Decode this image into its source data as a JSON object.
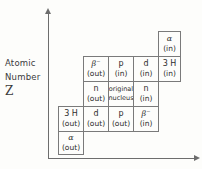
{
  "axis": {
    "y_label_line1": "Atomic",
    "y_label_line2": "Number",
    "y_label_symbol": "Z"
  },
  "chart_data": {
    "type": "diagram",
    "title": "",
    "xlabel": "",
    "ylabel": "Atomic Number Z",
    "grid": true,
    "legend": "none",
    "cells": [
      {
        "id": "alpha-in",
        "particle": "α",
        "direction": "(in)",
        "col": 4,
        "row": 0,
        "x": 158,
        "y": 31,
        "w": 23,
        "h": 26
      },
      {
        "id": "beta-minus-out",
        "particle": "β⁻",
        "direction": "(out)",
        "col": 1,
        "row": 1,
        "x": 83,
        "y": 56,
        "w": 26,
        "h": 26
      },
      {
        "id": "p-in",
        "particle": "p",
        "direction": "(in)",
        "col": 2,
        "row": 1,
        "x": 108,
        "y": 56,
        "w": 26,
        "h": 26
      },
      {
        "id": "d-in",
        "particle": "d",
        "direction": "(in)",
        "col": 3,
        "row": 1,
        "x": 133,
        "y": 56,
        "w": 26,
        "h": 26
      },
      {
        "id": "tritium-in",
        "particle": "3 H",
        "direction": "(in)",
        "col": 4,
        "row": 1,
        "x": 158,
        "y": 56,
        "w": 23,
        "h": 26
      },
      {
        "id": "n-out",
        "particle": "n",
        "direction": "(out)",
        "col": 1,
        "row": 2,
        "x": 83,
        "y": 81,
        "w": 26,
        "h": 26
      },
      {
        "id": "original-nucleus",
        "particle": "original",
        "direction": "nucleus",
        "col": 2,
        "row": 2,
        "x": 108,
        "y": 81,
        "w": 26,
        "h": 26
      },
      {
        "id": "n-in",
        "particle": "n",
        "direction": "(in)",
        "col": 3,
        "row": 2,
        "x": 133,
        "y": 81,
        "w": 26,
        "h": 26
      },
      {
        "id": "tritium-out",
        "particle": "3 H",
        "direction": "(out)",
        "col": 0,
        "row": 3,
        "x": 58,
        "y": 106,
        "w": 26,
        "h": 26
      },
      {
        "id": "d-out",
        "particle": "d",
        "direction": "(out)",
        "col": 1,
        "row": 3,
        "x": 83,
        "y": 106,
        "w": 26,
        "h": 26
      },
      {
        "id": "p-out",
        "particle": "p",
        "direction": "(out)",
        "col": 2,
        "row": 3,
        "x": 108,
        "y": 106,
        "w": 26,
        "h": 26
      },
      {
        "id": "beta-minus-in",
        "particle": "β⁻",
        "direction": "(in)",
        "col": 3,
        "row": 3,
        "x": 133,
        "y": 106,
        "w": 26,
        "h": 26
      },
      {
        "id": "alpha-out",
        "particle": "α",
        "direction": "(out)",
        "col": 0,
        "row": 4,
        "x": 58,
        "y": 131,
        "w": 26,
        "h": 24
      }
    ]
  }
}
